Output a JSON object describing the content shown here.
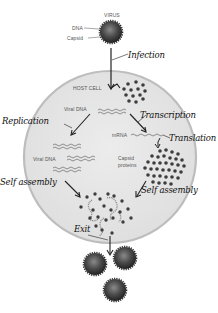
{
  "diagram": {
    "type": "viral replication cycle",
    "virus_labels": {
      "virus": "VIRUS",
      "dna": "DNA",
      "capsid": "Capsid"
    },
    "cell_labels": {
      "host_cell": "HOST CELL",
      "viral_dna_top": "Viral DNA",
      "viral_dna_bottom": "Viral DNA",
      "mrna": "mRNA",
      "capsid_proteins_line1": "Capsid",
      "capsid_proteins_line2": "proteins"
    },
    "steps": {
      "infection": "Infection",
      "replication": "Replication",
      "transcription": "Transcription",
      "translation": "Translation",
      "self_assembly_left": "Self assembly",
      "self_assembly_right": "Self assembly",
      "exit": "Exit"
    },
    "colors": {
      "cell_fill": "#e6e6e6",
      "cell_border": "#b9b9b9",
      "virus_core": "#3a3a3a",
      "virus_highlight": "#7a7a7a",
      "dot": "#3d3d3d",
      "arrow": "#222222"
    },
    "released_virions": 3
  }
}
